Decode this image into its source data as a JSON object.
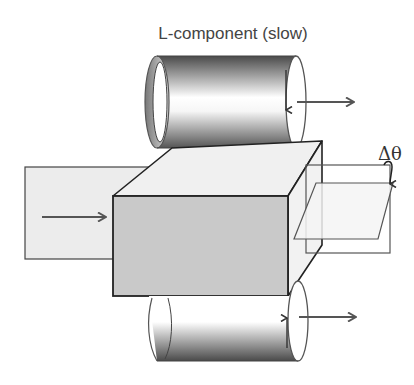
{
  "diagram": {
    "title": "L-component (slow)",
    "rotation_label": "Δθ",
    "colors": {
      "line": "#2a2a2a",
      "arrow": "#555555",
      "box_front": "#c9c9c9",
      "box_top": "#f0f0f0",
      "input_beam": "#ececec",
      "output_beam": "#f4f4f4",
      "cylinder_dark": "#555555",
      "cylinder_light": "#ffffff"
    },
    "elements": [
      {
        "id": "top-cylinder",
        "label": "rotating cylinder (top)"
      },
      {
        "id": "bottom-cylinder",
        "label": "rotating cylinder (bottom)"
      },
      {
        "id": "crystal-box",
        "label": "box"
      },
      {
        "id": "input-beam",
        "label": "input plane"
      },
      {
        "id": "output-beam",
        "label": "output plane (rotated)"
      }
    ]
  }
}
